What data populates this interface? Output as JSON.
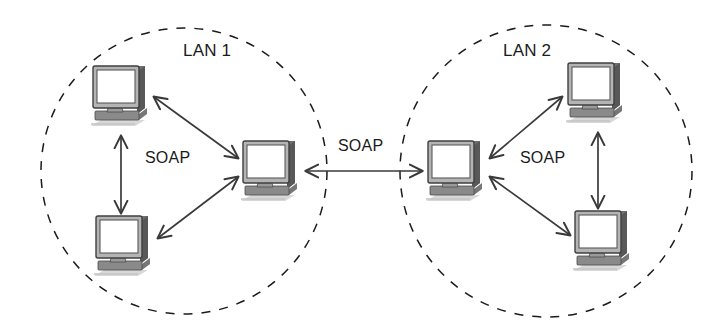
{
  "diagram": {
    "width": 718,
    "height": 331,
    "background_color": "#ffffff",
    "line_color": "#3a3a3a",
    "text_color": "#1b1b1b"
  },
  "zones": [
    {
      "id": "lan1",
      "label": "LAN 1",
      "shape": "dashed-circle",
      "cx": 184,
      "cy": 171,
      "r": 143,
      "label_x": 183,
      "label_y": 41,
      "stroke": "#1b1b1b"
    },
    {
      "id": "lan2",
      "label": "LAN 2",
      "shape": "dashed-circle",
      "cx": 546,
      "cy": 171,
      "r": 146,
      "label_x": 503,
      "label_y": 41,
      "stroke": "#1b1b1b"
    }
  ],
  "nodes": [
    {
      "id": "lan1-client-top",
      "icon": "desktop-computer-icon",
      "zone": "lan1",
      "x": 89,
      "y": 64,
      "w": 64,
      "h": 68
    },
    {
      "id": "lan1-client-bottom",
      "icon": "desktop-computer-icon",
      "zone": "lan1",
      "x": 92,
      "y": 214,
      "w": 64,
      "h": 68
    },
    {
      "id": "lan1-server",
      "icon": "desktop-computer-icon",
      "zone": "lan1",
      "x": 239,
      "y": 139,
      "w": 64,
      "h": 68
    },
    {
      "id": "lan2-server",
      "icon": "desktop-computer-icon",
      "zone": "lan2",
      "x": 424,
      "y": 139,
      "w": 64,
      "h": 68
    },
    {
      "id": "lan2-client-top",
      "icon": "desktop-computer-icon",
      "zone": "lan2",
      "x": 564,
      "y": 61,
      "w": 64,
      "h": 68
    },
    {
      "id": "lan2-client-bottom",
      "icon": "desktop-computer-icon",
      "zone": "lan2",
      "x": 571,
      "y": 209,
      "w": 64,
      "h": 68
    }
  ],
  "connections": [
    {
      "id": "lan1-vertical",
      "from": "lan1-client-top",
      "to": "lan1-client-bottom",
      "arrows": "both",
      "x1": 121,
      "y1": 136,
      "x2": 121,
      "y2": 213
    },
    {
      "id": "lan1-top-server",
      "from": "lan1-client-top",
      "to": "lan1-server",
      "arrows": "both",
      "x1": 154,
      "y1": 97,
      "x2": 238,
      "y2": 158
    },
    {
      "id": "lan1-bot-server",
      "from": "lan1-client-bottom",
      "to": "lan1-server",
      "arrows": "both",
      "x1": 158,
      "y1": 238,
      "x2": 238,
      "y2": 177
    },
    {
      "id": "inter-lan",
      "from": "lan1-server",
      "to": "lan2-server",
      "arrows": "both",
      "x1": 306,
      "y1": 171,
      "x2": 422,
      "y2": 171
    },
    {
      "id": "lan2-top-server",
      "from": "lan2-server",
      "to": "lan2-client-top",
      "arrows": "both",
      "x1": 490,
      "y1": 158,
      "x2": 562,
      "y2": 97
    },
    {
      "id": "lan2-bot-server",
      "from": "lan2-server",
      "to": "lan2-client-bottom",
      "arrows": "both",
      "x1": 490,
      "y1": 177,
      "x2": 570,
      "y2": 235
    },
    {
      "id": "lan2-vertical",
      "from": "lan2-client-top",
      "to": "lan2-client-bottom",
      "arrows": "both",
      "x1": 598,
      "y1": 133,
      "x2": 598,
      "y2": 208
    }
  ],
  "protocol_labels": [
    {
      "id": "soap-lan1",
      "text": "SOAP",
      "x": 145,
      "y": 149
    },
    {
      "id": "soap-inter",
      "text": "SOAP",
      "x": 338,
      "y": 137
    },
    {
      "id": "soap-lan2",
      "text": "SOAP",
      "x": 520,
      "y": 149
    }
  ]
}
